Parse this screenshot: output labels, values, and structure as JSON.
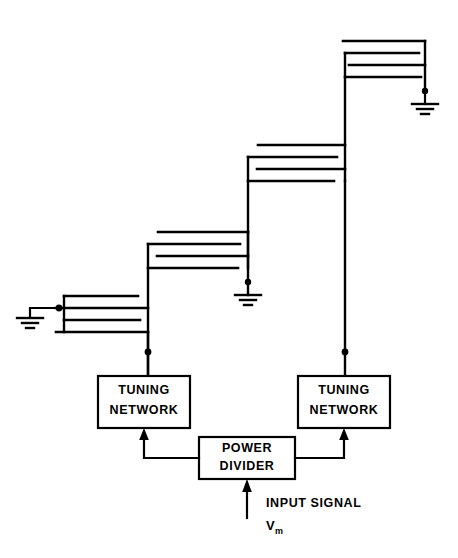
{
  "figure": {
    "type": "schematic-diagram",
    "background_color": "#ffffff",
    "line_color": "#000000"
  },
  "blocks": {
    "tuning_network_left": {
      "line1": "TUNING",
      "line2": "NETWORK",
      "x": 98,
      "y": 376,
      "width": 92,
      "height": 52
    },
    "tuning_network_right": {
      "line1": "TUNING",
      "line2": "NETWORK",
      "x": 298,
      "y": 376,
      "width": 92,
      "height": 52
    },
    "power_divider": {
      "line1": "POWER",
      "line2": "DIVIDER",
      "x": 199,
      "y": 437,
      "width": 96,
      "height": 42
    }
  },
  "labels": {
    "input_signal": "INPUT SIGNAL",
    "vm_symbol": "V",
    "vm_subscript": "m"
  },
  "icons": {
    "ground_left": "ground-icon",
    "ground_mid": "ground-icon",
    "ground_top": "ground-icon",
    "arrow_to_tuning_left": "arrow-up-icon",
    "arrow_to_tuning_right": "arrow-up-icon",
    "arrow_input": "arrow-up-icon"
  },
  "arrays": [
    {
      "name": "array-1-lowest-left",
      "boom_x": 64,
      "mast_x": 148,
      "element_x_left": 40,
      "element_x_right": 138,
      "elements_y": [
        296,
        308,
        320,
        332
      ],
      "feed_y": 352,
      "ground_stub_y": 308,
      "ground_x": 30
    },
    {
      "name": "array-2",
      "boom_x": 148,
      "mast_x": 248,
      "element_x_left": 158,
      "element_x_right": 238,
      "elements_y": [
        232,
        244,
        256,
        268
      ],
      "ground_y": 282,
      "ground_x": 248
    },
    {
      "name": "array-3",
      "boom_x": 248,
      "mast_x": 345,
      "element_x_left": 258,
      "element_x_right": 335,
      "elements_y": [
        145,
        157,
        169,
        181
      ]
    },
    {
      "name": "array-4-topmost",
      "boom_x": 345,
      "mast_x": 425,
      "element_x_left": 343,
      "element_x_right": 418,
      "elements_y": [
        41,
        53,
        65,
        77
      ],
      "ground_y": 91,
      "ground_x": 425
    }
  ],
  "connections": {
    "divider_to_left_tuning": true,
    "divider_to_right_tuning": true,
    "input_arrow_x": 247,
    "input_arrow_y_from": 518,
    "input_arrow_y_to": 481
  }
}
